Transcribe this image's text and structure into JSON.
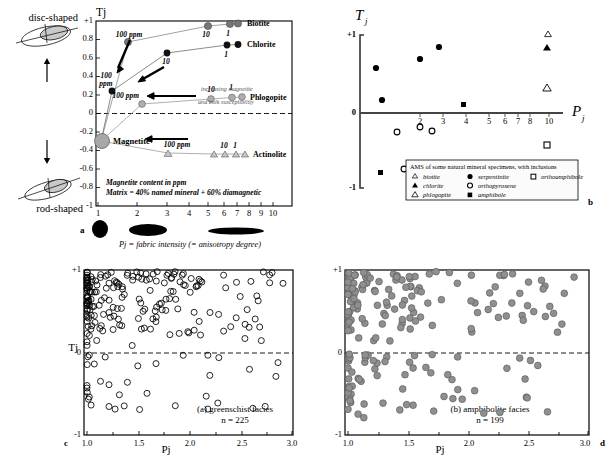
{
  "figure": {
    "panels": [
      "a",
      "b",
      "c",
      "d"
    ]
  },
  "panel_a": {
    "letter": "a",
    "ylabel": "Tj",
    "xlabel": "Pj = fabric intensity (= anisotropy degree)",
    "top_shape_label": "disc-shaped",
    "bottom_shape_label": "rod-shaped",
    "note_line1": "Magnetite content in ppm",
    "note_line2": "Matrix = 40% named mineral + 60% diamagnetic",
    "arrow_note_line1": "increasing magnetite",
    "arrow_note_line2": "and bulk susceptibility",
    "ppm_labels": [
      "100 ppm",
      "100 ppm",
      "100 ppm",
      "100 ppm",
      "100",
      "ppm"
    ],
    "series_labels": [
      "Biotite",
      "Chlorite",
      "Phlogopite",
      "Actinolite",
      "Magnetite"
    ],
    "yticks": [
      "+1",
      "0.8",
      "0.6",
      "0.4",
      "0.2",
      "0",
      "-0.2",
      "-0.4",
      "-0.6",
      "-0.8",
      "-1"
    ],
    "xticks": [
      "1",
      "2",
      "3",
      "4",
      "5",
      "6",
      "7",
      "8",
      "9",
      "10"
    ],
    "colors": {
      "dark": "#3a3a3a",
      "grey": "#9a9a9a",
      "lightgrey": "#bdbdbd",
      "axis": "#000000"
    }
  },
  "chart_data": [
    {
      "type": "scatter",
      "panel": "a",
      "title": "",
      "xlabel": "Pj = fabric intensity (= anisotropy degree)",
      "ylabel": "Tj",
      "xlim": [
        1,
        10
      ],
      "ylim": [
        -1,
        1
      ],
      "xscale": "log",
      "grid": false,
      "series": [
        {
          "name": "Biotite",
          "marker": "filled-circle",
          "color": "#555555",
          "points": [
            [
              1.0,
              -0.3
            ],
            [
              1.62,
              0.75
            ],
            [
              5.3,
              0.93
            ],
            [
              6.2,
              0.95
            ],
            [
              6.55,
              0.96
            ]
          ],
          "point_labels": [
            "",
            "100 ppm",
            "10",
            "1",
            ""
          ]
        },
        {
          "name": "Chlorite",
          "marker": "filled-circle",
          "color": "#1a1a1a",
          "points": [
            [
              1.0,
              -0.3
            ],
            [
              1.13,
              0.24
            ],
            [
              3.05,
              0.65
            ],
            [
              6.05,
              0.74
            ],
            [
              6.6,
              0.75
            ]
          ],
          "point_labels": [
            "",
            "100 ppm",
            "10",
            "1",
            ""
          ]
        },
        {
          "name": "Phlogopite",
          "marker": "filled-circle",
          "color": "#9a9a9a",
          "points": [
            [
              1.0,
              -0.3
            ],
            [
              1.72,
              0.1
            ],
            [
              5.5,
              0.16
            ],
            [
              6.35,
              0.18
            ],
            [
              6.75,
              0.19
            ]
          ],
          "point_labels": [
            "",
            "100 ppm",
            "10",
            "1",
            ""
          ]
        },
        {
          "name": "Actinolite",
          "marker": "triangle-up",
          "color": "#b0b0b0",
          "points": [
            [
              1.0,
              -0.3
            ],
            [
              3.1,
              -0.43
            ],
            [
              5.6,
              -0.44
            ],
            [
              6.0,
              -0.44
            ],
            [
              6.45,
              -0.44
            ],
            [
              6.8,
              -0.44
            ]
          ],
          "point_labels": [
            "",
            "100 ppm",
            "10",
            "1",
            "",
            ""
          ]
        },
        {
          "name": "Magnetite",
          "marker": "large-circle",
          "color": "#9a9a9a",
          "points": [
            [
              1.0,
              -0.3
            ]
          ],
          "point_labels": [
            "Magnetite"
          ]
        }
      ]
    },
    {
      "type": "scatter",
      "panel": "b",
      "xlabel": "Pj",
      "ylabel": "Tj",
      "xlim": [
        1,
        11
      ],
      "ylim": [
        -1,
        1
      ],
      "grid": false,
      "legend_title": "AMS of some natural mineral specimens, with inclusions",
      "legend_entries": [
        {
          "label": "biotite",
          "marker": "triangle-up-small"
        },
        {
          "label": "chlorite",
          "marker": "triangle-up-filled"
        },
        {
          "label": "phlogopite",
          "marker": "triangle-up-open"
        },
        {
          "label": "serpentinite",
          "marker": "filled-circle"
        },
        {
          "label": "orthopyroxene",
          "marker": "open-circle"
        },
        {
          "label": "amphibole",
          "marker": "filled-square"
        },
        {
          "label": "orthoamphibole",
          "marker": "open-square"
        }
      ],
      "series": [
        {
          "name": "serpentinite",
          "marker": "filled-circle",
          "points": [
            [
              1.25,
              0.52
            ],
            [
              1.3,
              0.09
            ],
            [
              2.0,
              0.63
            ],
            [
              2.62,
              0.78
            ]
          ]
        },
        {
          "name": "amphibole",
          "marker": "filled-square",
          "points": [
            [
              3.45,
              0.1
            ],
            [
              1.25,
              -0.88
            ]
          ]
        },
        {
          "name": "orthopyroxene",
          "marker": "open-circle",
          "points": [
            [
              1.55,
              -0.22
            ],
            [
              2.0,
              -0.16
            ],
            [
              2.4,
              -0.2
            ],
            [
              1.85,
              -0.82
            ]
          ]
        },
        {
          "name": "biotite",
          "marker": "triangle-up-small",
          "points": [
            [
              10.1,
              0.98
            ]
          ]
        },
        {
          "name": "chlorite",
          "marker": "triangle-up-filled",
          "points": [
            [
              10.0,
              0.77
            ]
          ]
        },
        {
          "name": "phlogopite",
          "marker": "triangle-up-open",
          "points": [
            [
              10.2,
              0.28
            ]
          ]
        },
        {
          "name": "orthoamphibole",
          "marker": "open-square",
          "points": [
            [
              10.0,
              -0.33
            ]
          ]
        }
      ],
      "yticks": [
        "+1",
        "0",
        "-1"
      ],
      "xticks": [
        "2",
        "3",
        "4",
        "5",
        "6",
        "7",
        "8",
        "10"
      ]
    },
    {
      "type": "scatter",
      "panel": "c",
      "title": "(a) greenschist facies",
      "subtitle": "n = 225",
      "n": 225,
      "xlabel": "Pj",
      "ylabel": "Tj",
      "xlim": [
        1.0,
        3.0
      ],
      "ylim": [
        -1,
        1
      ],
      "xticks": [
        "1.0",
        "1.5",
        "2.0",
        "2.5",
        "3.0"
      ],
      "yticks": [
        "+1",
        "0",
        "-1"
      ],
      "marker": "open-circle",
      "grid": false
    },
    {
      "type": "scatter",
      "panel": "d",
      "title": "(b) amphibolite facies",
      "subtitle": "n = 199",
      "n": 199,
      "xlabel": "Pj",
      "ylabel": "Tj",
      "xlim": [
        1.0,
        3.0
      ],
      "ylim": [
        -1,
        1
      ],
      "xticks": [
        "1.0",
        "1.5",
        "2.0",
        "2.5",
        "3.0"
      ],
      "yticks": [
        "+1",
        "0",
        "-1"
      ],
      "marker": "filled-grey-circle",
      "marker_color": "#8f8f8f",
      "grid": false
    }
  ],
  "panel_b": {
    "letter": "b",
    "ylabel_main": "T",
    "ylabel_sub": "j",
    "xlabel_main": "P",
    "xlabel_sub": "j"
  },
  "panel_c": {
    "letter": "c",
    "ylabel": "Tj",
    "xlabel": "Pj"
  },
  "panel_d": {
    "letter": "d",
    "ylabel": "Tj",
    "xlabel": "Pj"
  }
}
